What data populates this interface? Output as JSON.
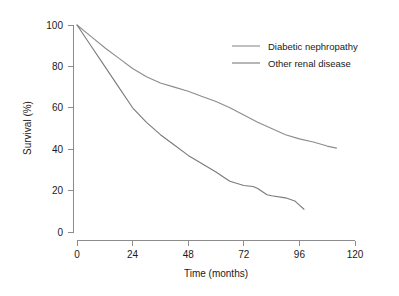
{
  "chart_data": {
    "type": "line",
    "title": "",
    "xlabel": "Time (months)",
    "ylabel": "Survival (%)",
    "xlim": [
      0,
      120
    ],
    "ylim": [
      0,
      100
    ],
    "xticks": [
      0,
      24,
      48,
      72,
      96,
      120
    ],
    "xtick_labels": [
      "0",
      "24",
      "48",
      "72",
      "96",
      "120"
    ],
    "yticks": [
      0,
      20,
      40,
      60,
      80,
      100
    ],
    "ytick_labels": [
      "0",
      "20",
      "40",
      "60",
      "80",
      "100"
    ],
    "grid": false,
    "legend_position": "top-right",
    "series": [
      {
        "name": "Diabetic nephropathy",
        "color": "#8c8c8c",
        "x": [
          0,
          6,
          12,
          18,
          24,
          30,
          36,
          42,
          48,
          54,
          60,
          66,
          72,
          78,
          84,
          90,
          96,
          102,
          108,
          112
        ],
        "values": [
          100,
          94.5,
          89,
          84,
          79,
          75,
          72,
          70,
          68,
          65.5,
          63,
          60,
          56.5,
          53,
          50,
          47,
          45,
          43.5,
          41.5,
          40.5
        ]
      },
      {
        "name": "Other renal disease",
        "color": "#7a7a7a",
        "x": [
          0,
          6,
          12,
          18,
          24,
          30,
          36,
          42,
          48,
          54,
          60,
          64,
          66,
          72,
          76,
          78,
          82,
          84,
          90,
          94,
          96,
          98
        ],
        "values": [
          100,
          90,
          80,
          70,
          60,
          53,
          47,
          42,
          37,
          33,
          29,
          26,
          24.5,
          22.5,
          22,
          21,
          18,
          17.5,
          16.5,
          15,
          13,
          11
        ]
      }
    ]
  },
  "legend": {
    "entries": [
      {
        "label": "Diabetic nephropathy"
      },
      {
        "label": "Other renal disease"
      }
    ]
  },
  "colors": {
    "axis": "#8c8c8c",
    "text": "#1a1a1a",
    "background": "#ffffff",
    "series_1": "#8c8c8c",
    "series_2": "#7a7a7a"
  }
}
